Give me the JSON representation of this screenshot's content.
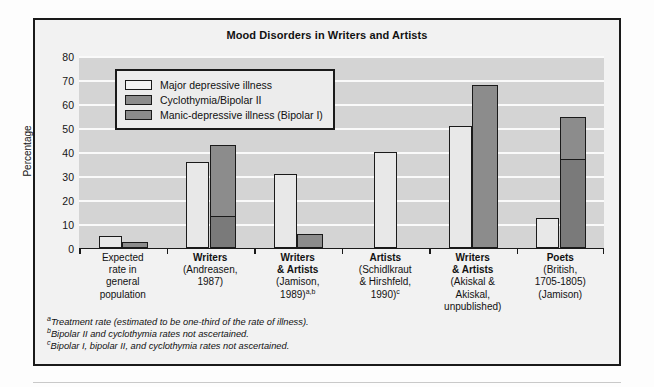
{
  "chart_data": {
    "type": "bar",
    "title": "Mood Disorders in Writers and Artists",
    "xlabel": "",
    "ylabel": "Percentage",
    "ylim": [
      0,
      80
    ],
    "yticks": [
      0,
      10,
      20,
      30,
      40,
      50,
      60,
      70,
      80
    ],
    "grid": true,
    "legend_position": "upper-left-inside",
    "legend": [
      {
        "label": "Major depressive illness",
        "color": "#f2f2f2"
      },
      {
        "label": "Cyclothymia/Bipolar II",
        "color": "#8c8c8c"
      },
      {
        "label": "Manic-depressive illness (Bipolar I)",
        "color": "#8c8c8c"
      }
    ],
    "categories": [
      {
        "heading": "Expected\nrate in\ngeneral\npopulation",
        "lines": [
          {
            "text": "Expected",
            "bold": false
          },
          {
            "text": "rate in",
            "bold": false
          },
          {
            "text": "general",
            "bold": false
          },
          {
            "text": "population",
            "bold": false
          }
        ]
      },
      {
        "lines": [
          {
            "text": "Writers",
            "bold": true
          },
          {
            "text": "(Andreasen,",
            "bold": false
          },
          {
            "text": "1987)",
            "bold": false
          }
        ]
      },
      {
        "lines": [
          {
            "text": "Writers",
            "bold": true
          },
          {
            "text": "& Artists",
            "bold": true
          },
          {
            "text": "(Jamison,",
            "bold": false
          },
          {
            "text": "1989)",
            "bold": false,
            "sup": "a,b"
          }
        ]
      },
      {
        "lines": [
          {
            "text": "Artists",
            "bold": true
          },
          {
            "text": "(Schidlkraut",
            "bold": false
          },
          {
            "text": "& Hirshfeld,",
            "bold": false
          },
          {
            "text": "1990)",
            "bold": false,
            "sup": "c"
          }
        ]
      },
      {
        "lines": [
          {
            "text": "Writers",
            "bold": true
          },
          {
            "text": "& Artists",
            "bold": true
          },
          {
            "text": "(Akiskal &",
            "bold": false
          },
          {
            "text": "Akiskal,",
            "bold": false
          },
          {
            "text": "unpublished)",
            "bold": false
          }
        ]
      },
      {
        "lines": [
          {
            "text": "Poets",
            "bold": true
          },
          {
            "text": "(British,",
            "bold": false
          },
          {
            "text": "1705-1805)",
            "bold": false
          },
          {
            "text": "(Jamison)",
            "bold": false
          }
        ]
      }
    ],
    "series": [
      {
        "name": "Major depressive illness",
        "values": [
          5,
          36,
          31,
          40,
          51,
          12.5
        ]
      },
      {
        "name": "Cyclothymia/Bipolar II",
        "values": [
          null,
          30,
          null,
          null,
          null,
          18
        ]
      },
      {
        "name": "Manic-depressive illness (Bipolar I)",
        "values": [
          2.5,
          13,
          6,
          null,
          68,
          36.5
        ]
      }
    ],
    "stacked_totals": [
      2.5,
      43,
      6,
      null,
      68,
      54.5
    ],
    "notes": [
      {
        "marker": "a",
        "text": "Treatment rate (estimated to be one-third of the rate of illness)."
      },
      {
        "marker": "b",
        "text": "Bipolar II and cyclothymia rates not ascertained."
      },
      {
        "marker": "c",
        "text": "Bipolar I, bipolar II, and cyclothymia rates not ascertained."
      }
    ],
    "colors": {
      "plot_background": "#d4d4d4",
      "figure_background": "#f2f2f2",
      "gridline": "#fafafa",
      "outline": "#1a1a1a",
      "light_bar": "#e8e8e8",
      "mid_bar": "#8c8c8c",
      "dark_bar": "#7a7a7a"
    }
  }
}
